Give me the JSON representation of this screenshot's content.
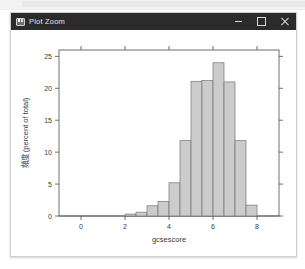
{
  "window": {
    "title": "Plot Zoom",
    "icon": "plot-window-icon",
    "controls": {
      "minimize": "minimize-icon",
      "maximize": "maximize-icon",
      "close": "close-icon"
    }
  },
  "chart_data": {
    "type": "bar",
    "title": "",
    "subtitle": "",
    "xlabel": "gcsescore",
    "ylabel": "頻度 (percent of total)",
    "xlim": [
      -1.0,
      9.0
    ],
    "ylim": [
      0,
      26
    ],
    "xticks": [
      0,
      2,
      4,
      6,
      8
    ],
    "yticks": [
      0,
      5,
      10,
      15,
      20,
      25
    ],
    "grid": false,
    "legend": null,
    "bin_width": 0.5,
    "bin_starts": [
      2.0,
      2.5,
      3.0,
      3.5,
      4.0,
      4.5,
      5.0,
      5.5,
      6.0,
      6.5,
      7.0,
      7.5
    ],
    "categories": [
      "2.0-2.5",
      "2.5-3.0",
      "3.0-3.5",
      "3.5-4.0",
      "4.0-4.5",
      "4.5-5.0",
      "5.0-5.5",
      "5.5-6.0",
      "6.0-6.5",
      "6.5-7.0",
      "7.0-7.5",
      "7.5-8.0"
    ],
    "values": [
      0.3,
      0.6,
      1.6,
      2.3,
      5.2,
      11.8,
      21.1,
      21.2,
      24.0,
      21.0,
      11.8,
      1.7
    ],
    "bar_fill": "#cccccc",
    "bar_stroke": "#737373"
  }
}
